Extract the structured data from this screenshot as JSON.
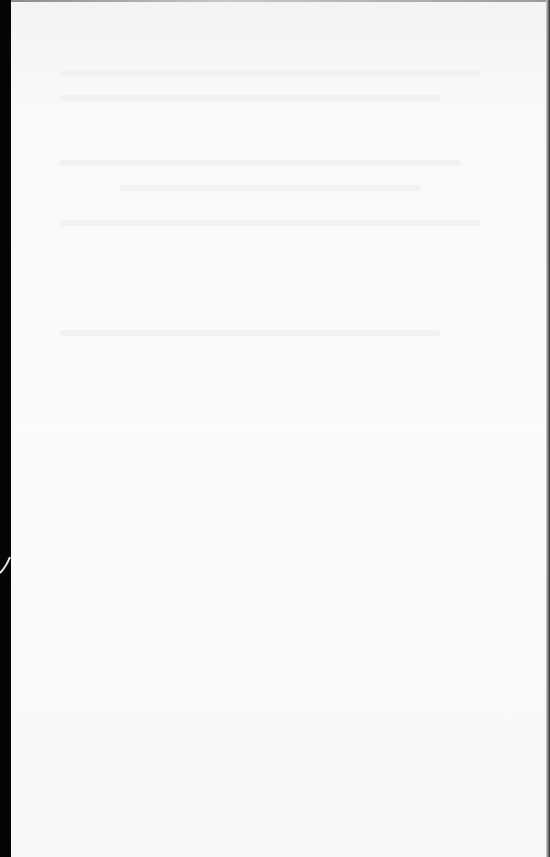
{
  "document": {
    "type": "scanned-blank-page",
    "visible_text": "",
    "colors": {
      "paper": "#fafafa",
      "border": "#050505"
    }
  }
}
